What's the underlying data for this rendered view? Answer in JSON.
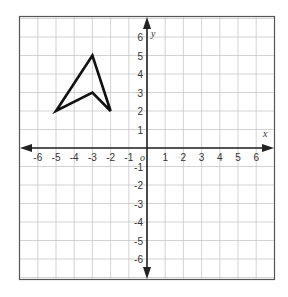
{
  "figure": {
    "title_fragment": "",
    "axes": {
      "x_label": "x",
      "y_label": "y",
      "origin_label": "o",
      "x_min": -6,
      "x_max": 6,
      "y_min": -6,
      "y_max": 6,
      "x_ticks": [
        "-6",
        "-5",
        "-4",
        "-3",
        "-2",
        "-1",
        "1",
        "2",
        "3",
        "4",
        "5",
        "6"
      ],
      "y_ticks": [
        "6",
        "5",
        "4",
        "3",
        "2",
        "1",
        "-1",
        "-2",
        "-3",
        "-4",
        "-5",
        "-6"
      ]
    },
    "grid": {
      "visible": true,
      "range": [
        -7,
        7
      ],
      "color": "#c8c8c8"
    },
    "shape": {
      "name": "arrowhead quadrilateral",
      "vertices": [
        [
          -5,
          2
        ],
        [
          -3,
          5
        ],
        [
          -2,
          2
        ],
        [
          -3,
          3
        ]
      ],
      "stroke": "#111111"
    },
    "colors": {
      "axis": "#222222",
      "frame": "#555555",
      "grid": "#c8c8c8"
    }
  }
}
